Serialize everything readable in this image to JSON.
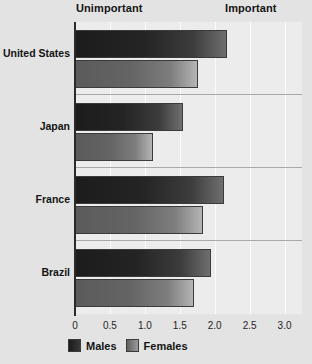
{
  "chart_data": {
    "type": "bar",
    "orientation": "horizontal",
    "title": "",
    "subtitle": "",
    "xlabel": "",
    "ylabel": "",
    "categories": [
      "United States",
      "Japan",
      "France",
      "Brazil"
    ],
    "series": [
      {
        "name": "Males",
        "values": [
          2.18,
          1.54,
          2.13,
          1.94
        ]
      },
      {
        "name": "Females",
        "values": [
          1.76,
          1.12,
          1.83,
          1.71
        ]
      }
    ],
    "xlim": [
      0,
      3.25
    ],
    "xticks": [
      0,
      0.5,
      1.0,
      1.5,
      2.0,
      2.5,
      3.0
    ],
    "xtick_labels": [
      "0",
      "0.5",
      "1.0",
      "1.5",
      "2.0",
      "2.5",
      "3.0"
    ],
    "grid": "vertical",
    "legend_position": "bottom-left",
    "annotations": [
      {
        "text": "Unimportant",
        "position": "top-left"
      },
      {
        "text": "Important",
        "position": "top-right"
      }
    ]
  },
  "headers": {
    "unimportant": "Unimportant",
    "important": "Important"
  },
  "legend": {
    "males": "Males",
    "females": "Females"
  },
  "colors": {
    "background": "#e3e3e3",
    "plot_background": "#ececec",
    "males_bar": "#202020",
    "females_bar": "#6b6b6b",
    "axis": "#2a2a2a",
    "gridline": "#fbfbfb",
    "text": "#141414"
  },
  "axis": {
    "tick_0": "0",
    "tick_1": "0.5",
    "tick_2": "1.0",
    "tick_3": "1.5",
    "tick_4": "2.0",
    "tick_5": "2.5",
    "tick_6": "3.0"
  },
  "categories": {
    "c0": "United States",
    "c1": "Japan",
    "c2": "France",
    "c3": "Brazil"
  }
}
